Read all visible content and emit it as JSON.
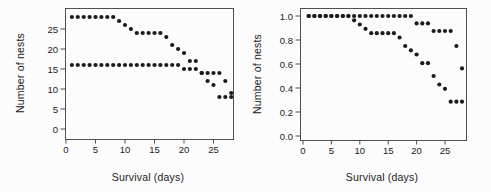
{
  "style": {
    "background": "#fcfcfc",
    "axis_color": "#4f4f4f",
    "marker_color": "#1b1b1b",
    "text_color": "#1a1a1a"
  },
  "chart_data": [
    {
      "type": "scatter",
      "name": "nest-count-chart",
      "title": "",
      "xlabel": "Survival (days)",
      "ylabel": "Number of nests",
      "xlim": [
        0,
        28.5
      ],
      "ylim": [
        0,
        30
      ],
      "grid": false,
      "legend": null,
      "xticks": [
        0,
        5,
        10,
        15,
        20,
        25
      ],
      "xtick_labels": [
        "0",
        "5",
        "10",
        "15",
        "20",
        "25"
      ],
      "yticks": [
        0,
        5,
        10,
        15,
        20,
        25
      ],
      "ytick_labels": [
        "0",
        "5",
        "10",
        "15",
        "20",
        "25"
      ],
      "series": [
        {
          "name": "group-1-nests",
          "x": [
            1,
            2,
            3,
            4,
            5,
            6,
            7,
            8,
            9,
            10,
            11,
            12,
            13,
            14,
            15,
            16,
            17,
            18,
            19,
            20,
            21,
            22,
            23,
            24,
            25,
            26,
            27,
            28
          ],
          "y": [
            28,
            28,
            28,
            28,
            28,
            28,
            28,
            28,
            27,
            26,
            25,
            24,
            24,
            24,
            24,
            24,
            23,
            21,
            20,
            19,
            17,
            17,
            14,
            12,
            11,
            8,
            8,
            8
          ]
        },
        {
          "name": "group-2-nests",
          "x": [
            1,
            2,
            3,
            4,
            5,
            6,
            7,
            8,
            9,
            10,
            11,
            12,
            13,
            14,
            15,
            16,
            17,
            18,
            19,
            20,
            21,
            22,
            23,
            24,
            25,
            26,
            27,
            28
          ],
          "y": [
            16,
            16,
            16,
            16,
            16,
            16,
            16,
            16,
            16,
            16,
            16,
            16,
            16,
            16,
            16,
            16,
            16,
            16,
            16,
            15,
            15,
            15,
            14,
            14,
            14,
            14,
            12,
            9
          ]
        }
      ]
    },
    {
      "type": "scatter",
      "name": "nest-proportion-chart",
      "title": "",
      "xlabel": "Survival (days)",
      "ylabel": "Number of nests",
      "xlim": [
        0,
        28.5
      ],
      "ylim": [
        0,
        1.05
      ],
      "grid": false,
      "legend": null,
      "xticks": [
        0,
        5,
        10,
        15,
        20,
        25
      ],
      "xtick_labels": [
        "0",
        "5",
        "10",
        "15",
        "20",
        "25"
      ],
      "yticks": [
        0.0,
        0.2,
        0.4,
        0.6,
        0.8,
        1.0
      ],
      "ytick_labels": [
        "0.0",
        "0.2",
        "0.4",
        "0.6",
        "0.8",
        "1.0"
      ],
      "series": [
        {
          "name": "group-1-proportion",
          "x": [
            1,
            2,
            3,
            4,
            5,
            6,
            7,
            8,
            9,
            10,
            11,
            12,
            13,
            14,
            15,
            16,
            17,
            18,
            19,
            20,
            21,
            22,
            23,
            24,
            25,
            26,
            27,
            28
          ],
          "y": [
            1.0,
            1.0,
            1.0,
            1.0,
            1.0,
            1.0,
            1.0,
            1.0,
            0.964,
            0.929,
            0.893,
            0.857,
            0.857,
            0.857,
            0.857,
            0.857,
            0.821,
            0.75,
            0.714,
            0.679,
            0.607,
            0.607,
            0.5,
            0.429,
            0.393,
            0.286,
            0.286,
            0.286
          ]
        },
        {
          "name": "group-2-proportion",
          "x": [
            1,
            2,
            3,
            4,
            5,
            6,
            7,
            8,
            9,
            10,
            11,
            12,
            13,
            14,
            15,
            16,
            17,
            18,
            19,
            20,
            21,
            22,
            23,
            24,
            25,
            26,
            27,
            28
          ],
          "y": [
            1.0,
            1.0,
            1.0,
            1.0,
            1.0,
            1.0,
            1.0,
            1.0,
            1.0,
            1.0,
            1.0,
            1.0,
            1.0,
            1.0,
            1.0,
            1.0,
            1.0,
            1.0,
            1.0,
            0.938,
            0.938,
            0.938,
            0.875,
            0.875,
            0.875,
            0.875,
            0.75,
            0.563
          ]
        }
      ]
    }
  ]
}
